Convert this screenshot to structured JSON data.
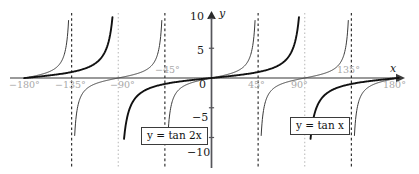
{
  "figure": {
    "type": "line",
    "background": "#ffffff",
    "axis_color": "#9a9a9a",
    "tick_label_color": "#a8a8a8",
    "ynum_color": "#1a1a1a",
    "curve_thin_color": "#3a3a3a",
    "curve_thick_color": "#111111",
    "asymptote_dark_color": "#2b2b2b",
    "asymptote_light_color": "#b9b9b9"
  },
  "axes": {
    "x_axis_name": "x",
    "y_axis_name": "y",
    "x_ticks": [
      {
        "label": "−180°",
        "value": -180
      },
      {
        "label": "−135°",
        "value": -135
      },
      {
        "label": "−90°",
        "value": -90
      },
      {
        "label": "−45°",
        "value": -45
      },
      {
        "label": "45°",
        "value": 45
      },
      {
        "label": "90°",
        "value": 90
      },
      {
        "label": "135°",
        "value": 135
      },
      {
        "label": "180°",
        "value": 180
      }
    ],
    "y_ticks": [
      {
        "label": "10",
        "value": 10
      },
      {
        "label": "5",
        "value": 5
      },
      {
        "label": "0",
        "value": 0
      },
      {
        "label": "−5",
        "value": -5
      },
      {
        "label": "−10",
        "value": -10
      }
    ],
    "xlim": [
      -180,
      180
    ],
    "ylim": [
      -10,
      10
    ]
  },
  "annotations": {
    "eq_tan2x": "y = tan 2x",
    "eq_tanx": "y = tan x"
  },
  "chart_data": {
    "type": "line",
    "title": "",
    "xlabel": "x",
    "ylabel": "y",
    "xlim": [
      -180,
      180
    ],
    "ylim": [
      -10,
      10
    ],
    "x_unit": "degrees",
    "grid": false,
    "legend": "inline-boxed-labels",
    "x_ticks": [
      -180,
      -135,
      -90,
      -45,
      45,
      90,
      135,
      180
    ],
    "y_ticks": [
      10,
      5,
      0,
      -5,
      -10
    ],
    "series": [
      {
        "name": "y = tan 2x",
        "expression": "tan(2x)",
        "style": "thin",
        "color": "#3a3a3a",
        "period": 90,
        "asymptotes": [
          -135,
          -45,
          45,
          135
        ],
        "asymptote_style": "dashed-dark",
        "zeros": [
          -180,
          -90,
          0,
          90,
          180
        ]
      },
      {
        "name": "y = tan x",
        "expression": "tan(x)",
        "style": "thick",
        "color": "#111111",
        "period": 180,
        "asymptotes": [
          -90,
          90
        ],
        "asymptote_style": "dotted-light",
        "zeros": [
          -180,
          0,
          180
        ]
      }
    ]
  }
}
